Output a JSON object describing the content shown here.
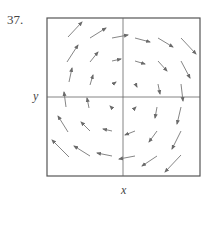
{
  "problem": {
    "number": "37."
  },
  "axes": {
    "x_label": "x",
    "y_label": "y"
  },
  "colors": {
    "frame": "#555555",
    "axis": "#666666",
    "arrow": "#777777"
  },
  "frame": {
    "left": 47,
    "top": 18,
    "right": 200,
    "bottom": 176
  },
  "origin": {
    "x": 123,
    "y": 97
  },
  "vector_field": {
    "description": "Clockwise rotational vector field, magnitude increasing with distance from origin (e.g. F = (y, -x))",
    "arrows": [
      {
        "x1": 68,
        "y1": 37,
        "x2": 82,
        "y2": 22
      },
      {
        "x1": 90,
        "y1": 38,
        "x2": 106,
        "y2": 28
      },
      {
        "x1": 112,
        "y1": 38,
        "x2": 128,
        "y2": 35
      },
      {
        "x1": 135,
        "y1": 38,
        "x2": 150,
        "y2": 42
      },
      {
        "x1": 158,
        "y1": 38,
        "x2": 173,
        "y2": 47
      },
      {
        "x1": 181,
        "y1": 38,
        "x2": 196,
        "y2": 54
      },
      {
        "x1": 67,
        "y1": 62,
        "x2": 78,
        "y2": 45
      },
      {
        "x1": 90,
        "y1": 62,
        "x2": 98,
        "y2": 52
      },
      {
        "x1": 112,
        "y1": 61,
        "x2": 121,
        "y2": 59
      },
      {
        "x1": 135,
        "y1": 61,
        "x2": 145,
        "y2": 64
      },
      {
        "x1": 158,
        "y1": 61,
        "x2": 167,
        "y2": 71
      },
      {
        "x1": 181,
        "y1": 61,
        "x2": 190,
        "y2": 78
      },
      {
        "x1": 69,
        "y1": 82,
        "x2": 72,
        "y2": 68
      },
      {
        "x1": 90,
        "y1": 85,
        "x2": 93,
        "y2": 75
      },
      {
        "x1": 113,
        "y1": 84,
        "x2": 116,
        "y2": 82
      },
      {
        "x1": 136,
        "y1": 85,
        "x2": 137,
        "y2": 87
      },
      {
        "x1": 158,
        "y1": 84,
        "x2": 160,
        "y2": 94
      },
      {
        "x1": 181,
        "y1": 84,
        "x2": 183,
        "y2": 101
      },
      {
        "x1": 66,
        "y1": 107,
        "x2": 64,
        "y2": 92
      },
      {
        "x1": 89,
        "y1": 108,
        "x2": 87,
        "y2": 98
      },
      {
        "x1": 112,
        "y1": 108,
        "x2": 110,
        "y2": 106
      },
      {
        "x1": 134,
        "y1": 109,
        "x2": 136,
        "y2": 107
      },
      {
        "x1": 157,
        "y1": 107,
        "x2": 155,
        "y2": 118
      },
      {
        "x1": 181,
        "y1": 107,
        "x2": 177,
        "y2": 124
      },
      {
        "x1": 68,
        "y1": 132,
        "x2": 58,
        "y2": 116
      },
      {
        "x1": 90,
        "y1": 131,
        "x2": 81,
        "y2": 122
      },
      {
        "x1": 112,
        "y1": 131,
        "x2": 103,
        "y2": 129
      },
      {
        "x1": 135,
        "y1": 131,
        "x2": 125,
        "y2": 135
      },
      {
        "x1": 157,
        "y1": 131,
        "x2": 149,
        "y2": 142
      },
      {
        "x1": 181,
        "y1": 131,
        "x2": 172,
        "y2": 149
      },
      {
        "x1": 69,
        "y1": 157,
        "x2": 52,
        "y2": 140
      },
      {
        "x1": 90,
        "y1": 156,
        "x2": 74,
        "y2": 146
      },
      {
        "x1": 112,
        "y1": 156,
        "x2": 97,
        "y2": 153
      },
      {
        "x1": 135,
        "y1": 156,
        "x2": 119,
        "y2": 159
      },
      {
        "x1": 157,
        "y1": 156,
        "x2": 142,
        "y2": 166
      },
      {
        "x1": 181,
        "y1": 155,
        "x2": 165,
        "y2": 172
      }
    ]
  }
}
